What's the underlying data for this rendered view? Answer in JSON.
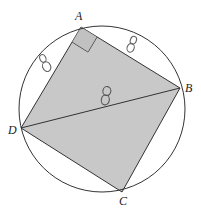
{
  "diagram": {
    "colors": {
      "background": "#ffffff",
      "fill": "#c8c8c8",
      "stroke": "#333333",
      "annotation": "#666666"
    },
    "circle": {
      "cx": 102,
      "cy": 109,
      "r": 83
    },
    "vertices": {
      "A": {
        "label": "A",
        "x": 81,
        "y": 27
      },
      "B": {
        "label": "B",
        "x": 180,
        "y": 88
      },
      "C": {
        "label": "C",
        "x": 122,
        "y": 192
      },
      "D": {
        "label": "D",
        "x": 21,
        "y": 128
      }
    },
    "diagonal": {
      "from": "D",
      "to": "B"
    },
    "right_angle_marker": {
      "at": "A"
    },
    "annotations": [
      {
        "text": "8",
        "position": "side AD",
        "x": 42,
        "y": 60
      },
      {
        "text": "8",
        "position": "side AB",
        "x": 132,
        "y": 44
      },
      {
        "text": "8",
        "position": "diagonal DB",
        "x": 104,
        "y": 99
      }
    ]
  }
}
